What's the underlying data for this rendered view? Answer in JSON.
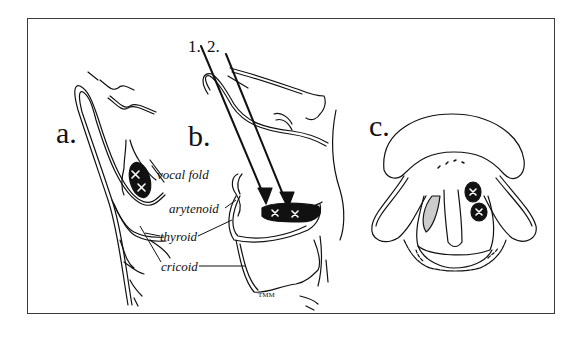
{
  "figure": {
    "panels": [
      {
        "id": "a",
        "label": "a."
      },
      {
        "id": "b",
        "label": "b."
      },
      {
        "id": "c",
        "label": "c."
      }
    ],
    "anatomy_labels": {
      "vocal_fold": "vocal fold",
      "arytenoid": "arytenoid",
      "thyroid": "thyroid",
      "cricoid": "cricoid"
    },
    "arrow_labels": {
      "first": "1.",
      "second": "2."
    },
    "marker_glyph": "×",
    "artist_signature": "TMM",
    "colors": {
      "ink": "#111111",
      "frame": "#3a3a3a",
      "background": "#ffffff"
    }
  }
}
